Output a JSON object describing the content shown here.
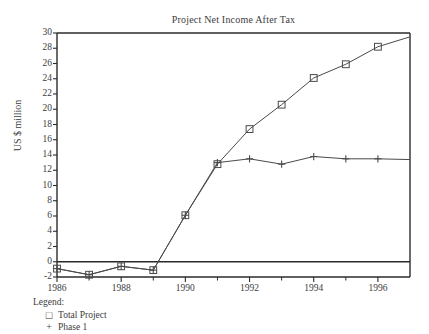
{
  "chart_data": {
    "type": "line",
    "title": "Project Net Income After Tax",
    "xlabel": "",
    "ylabel": "US $ million",
    "xlim": [
      1986,
      1997
    ],
    "ylim": [
      -2,
      30
    ],
    "ytick_step": 2,
    "yticks": [
      -2,
      0,
      2,
      4,
      6,
      8,
      10,
      12,
      14,
      16,
      18,
      20,
      22,
      24,
      26,
      28,
      30
    ],
    "ytick_labels": [
      "-2",
      "0",
      "2",
      "4",
      "6",
      "8",
      "10",
      "12",
      "14",
      "16",
      "18",
      "20",
      "22",
      "24",
      "26",
      "28",
      "30"
    ],
    "xticks_major": [
      1986,
      1988,
      1990,
      1992,
      1994,
      1996
    ],
    "xtick_labels": [
      "1986",
      "1988",
      "1990",
      "1992",
      "1994",
      "1996"
    ],
    "xticks_minor": [
      1987,
      1989,
      1991,
      1993,
      1995
    ],
    "grid": false,
    "zero_line": true,
    "legend_position": "below-left",
    "legend_title": "Legend:",
    "series": [
      {
        "name": "Total Project",
        "marker": "square",
        "x": [
          1986,
          1987,
          1988,
          1989,
          1990,
          1991,
          1992,
          1993,
          1994,
          1995,
          1996,
          1997
        ],
        "values": [
          -0.9,
          -1.7,
          -0.6,
          -1.1,
          6.1,
          12.8,
          17.4,
          20.6,
          24.1,
          25.9,
          28.2,
          29.5
        ],
        "marker_x": [
          1986,
          1987,
          1988,
          1989,
          1990,
          1991,
          1992,
          1993,
          1994,
          1995,
          1996
        ],
        "marker_values": [
          -0.9,
          -1.7,
          -0.6,
          -1.1,
          6.1,
          12.8,
          17.4,
          20.6,
          24.1,
          25.9,
          28.2
        ]
      },
      {
        "name": "Phase 1",
        "marker": "plus",
        "x": [
          1986,
          1987,
          1988,
          1989,
          1990,
          1991,
          1992,
          1993,
          1994,
          1995,
          1996,
          1997
        ],
        "values": [
          -0.9,
          -1.7,
          -0.6,
          -1.1,
          6.1,
          13.0,
          13.5,
          12.8,
          13.8,
          13.5,
          13.5,
          13.4
        ],
        "marker_x": [
          1986,
          1987,
          1988,
          1989,
          1990,
          1991,
          1992,
          1993,
          1994,
          1995,
          1996
        ],
        "marker_values": [
          -0.9,
          -1.7,
          -0.6,
          -1.1,
          6.1,
          13.0,
          13.5,
          12.8,
          13.8,
          13.5,
          13.5
        ]
      }
    ]
  },
  "legend": {
    "title": "Legend:",
    "items": [
      {
        "marker": "□",
        "label": "Total Project"
      },
      {
        "marker": "+",
        "label": "Phase 1"
      }
    ]
  },
  "colors": {
    "line": "#4a4a4a",
    "axis": "#2b2b2b",
    "text": "#3c3c3c",
    "background": "#ffffff"
  }
}
